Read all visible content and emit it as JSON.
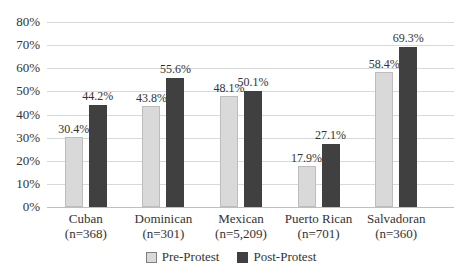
{
  "chart_data": {
    "type": "bar",
    "title": "",
    "xlabel": "",
    "ylabel": "",
    "ylim": [
      0,
      80
    ],
    "ytick_step": 10,
    "ytick_labels_top_down": [
      "80%",
      "70%",
      "60%",
      "50%",
      "40%",
      "30%",
      "20%",
      "10%",
      "0%"
    ],
    "grid": "horizontal",
    "legend_position": "bottom-center",
    "categories": [
      {
        "label": "Cuban",
        "n": "(n=368)"
      },
      {
        "label": "Dominican",
        "n": "(n=301)"
      },
      {
        "label": "Mexican",
        "n": "(n=5,209)"
      },
      {
        "label": "Puerto Rican",
        "n": "(n=701)"
      },
      {
        "label": "Salvadoran",
        "n": "(n=360)"
      }
    ],
    "series": [
      {
        "name": "Pre-Protest",
        "values": [
          30.4,
          43.8,
          48.1,
          17.9,
          58.4
        ],
        "value_labels": [
          "30.4%",
          "43.8%",
          "48.1%",
          "17.9%",
          "58.4%"
        ],
        "color": "#d9d9d9",
        "bar_border": "#bdbdbd",
        "swatch_border": "#7f7f7f"
      },
      {
        "name": "Post-Protest",
        "values": [
          44.2,
          55.6,
          50.1,
          27.1,
          69.3
        ],
        "value_labels": [
          "44.2%",
          "55.6%",
          "50.1%",
          "27.1%",
          "69.3%"
        ],
        "color": "#404040",
        "bar_border": "",
        "swatch_border": "#404040"
      }
    ],
    "colors": {
      "gridline": "#d9d9d9",
      "axis_line": "#bfbfbf",
      "text": "#333333",
      "background": "#ffffff"
    }
  }
}
